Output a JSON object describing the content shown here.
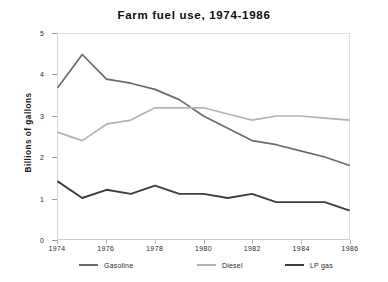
{
  "chart_data": {
    "type": "line",
    "title": "Farm fuel use, 1974-1986",
    "xlabel": "",
    "ylabel": "Billions of gallons",
    "x": [
      1974,
      1975,
      1976,
      1977,
      1978,
      1979,
      1980,
      1981,
      1982,
      1983,
      1984,
      1985,
      1986
    ],
    "xlim": [
      1974,
      1986
    ],
    "ylim": [
      0,
      5
    ],
    "xticks": [
      1974,
      1976,
      1978,
      1980,
      1982,
      1984,
      1986
    ],
    "xtick_labels": [
      "1974",
      "1976",
      "1978",
      "1980",
      "1982",
      "1984",
      "1986"
    ],
    "yticks": [
      0,
      1,
      2,
      3,
      4,
      5
    ],
    "ytick_labels": [
      "0",
      "1",
      "2",
      "3",
      "4",
      "5"
    ],
    "grid": false,
    "legend_position": "below",
    "series": [
      {
        "name": "Gasoline",
        "color": "#6b6b6b",
        "width": 1.7,
        "values": [
          3.7,
          4.5,
          3.9,
          3.8,
          3.65,
          3.4,
          3.0,
          2.7,
          2.4,
          2.3,
          2.15,
          2.0,
          1.8
        ]
      },
      {
        "name": "Diesel",
        "color": "#b3b3b3",
        "width": 1.7,
        "values": [
          2.6,
          2.4,
          2.8,
          2.9,
          3.2,
          3.2,
          3.2,
          3.05,
          2.9,
          3.0,
          3.0,
          2.95,
          2.9
        ]
      },
      {
        "name": "LP gas",
        "color": "#3d3d3d",
        "width": 1.9,
        "values": [
          1.4,
          1.0,
          1.2,
          1.1,
          1.3,
          1.1,
          1.1,
          1.0,
          1.1,
          0.9,
          0.9,
          0.9,
          0.7
        ]
      }
    ]
  },
  "legend": {
    "entries": [
      {
        "label": "Gasoline",
        "color": "#6b6b6b"
      },
      {
        "label": "Diesel",
        "color": "#b3b3b3"
      },
      {
        "label": "LP gas",
        "color": "#3d3d3d"
      }
    ]
  },
  "edge": {
    "cutoff_text": ""
  }
}
